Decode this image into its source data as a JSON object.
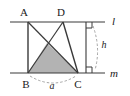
{
  "figure": {
    "background_color": "#ffffff",
    "stroke_color": "#3a3a3a",
    "dash_color": "#8c8c8c",
    "shade_color": "#b3b3b3",
    "width": 130,
    "height": 96
  },
  "lines": {
    "top": {
      "name": "l",
      "label": "l",
      "label_x": 113,
      "label_y": 24,
      "y": 22,
      "x_start": 10,
      "x_end": 105
    },
    "bottom": {
      "name": "m",
      "label": "m",
      "label_x": 112,
      "label_y": 77,
      "y": 73,
      "x_start": 10,
      "x_end": 105
    }
  },
  "vertices": [
    {
      "id": "A",
      "label": "A",
      "x": 28,
      "y": 22,
      "label_x": 24,
      "label_y": 16
    },
    {
      "id": "D",
      "label": "D",
      "x": 63,
      "y": 22,
      "label_x": 59,
      "label_y": 16
    },
    {
      "id": "B",
      "label": "B",
      "x": 28,
      "y": 73,
      "label_x": 24,
      "label_y": 87
    },
    {
      "id": "C",
      "label": "C",
      "x": 78,
      "y": 73,
      "label_x": 75,
      "label_y": 87
    }
  ],
  "segments": [
    {
      "id": "AB",
      "from": "A",
      "to": "B"
    },
    {
      "id": "AC",
      "from": "A",
      "to": "C"
    },
    {
      "id": "DB",
      "from": "D",
      "to": "B"
    },
    {
      "id": "DC",
      "from": "D",
      "to": "C"
    }
  ],
  "shaded_triangle": {
    "id": "BPC",
    "points": "28,73 47,43 78,73",
    "apex_x": 47,
    "apex_y": 43,
    "fill": "#b3b3b3"
  },
  "height_marker": {
    "label": "h",
    "label_x": 101,
    "label_y": 46,
    "line_x": 86,
    "y_top": 22,
    "y_bottom": 73,
    "right_angle_size": 6
  },
  "base_marker": {
    "label": "a",
    "label_x": 50,
    "label_y": 89,
    "arc_from_x": 30,
    "arc_to_x": 76,
    "arc_y": 76,
    "arc_sag": 10
  }
}
